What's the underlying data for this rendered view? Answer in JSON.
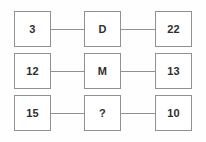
{
  "diagram": {
    "type": "grid-equation-puzzle",
    "colors": {
      "border": "#919191",
      "box_background": "#ffffff",
      "canvas_background": "#fefefe",
      "text": "#2e2e2e",
      "connector": "#919191"
    },
    "rows": [
      {
        "left": "3",
        "middle": "D",
        "right": "22"
      },
      {
        "left": "12",
        "middle": "M",
        "right": "13"
      },
      {
        "left": "15",
        "middle": "?",
        "right": "10"
      }
    ]
  }
}
